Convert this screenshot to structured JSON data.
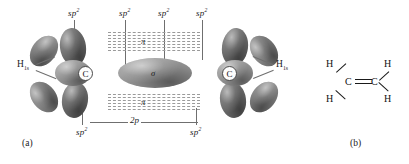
{
  "figure": {
    "panels": [
      {
        "caption": "(a)",
        "description": "sp2 hybrid orbital model of ethene with 2p pi overlap"
      },
      {
        "caption": "(b)",
        "description": "Lewis structure of ethene"
      }
    ]
  },
  "panel_a": {
    "caption": "(a)",
    "hybrid_labels": [
      {
        "text": "sp",
        "exponent": "2"
      },
      {
        "text": "sp",
        "exponent": "2"
      },
      {
        "text": "sp",
        "exponent": "2"
      },
      {
        "text": "sp",
        "exponent": "2"
      },
      {
        "text": "sp",
        "exponent": "2"
      },
      {
        "text": "sp",
        "exponent": "2"
      }
    ],
    "p_orbital_label": "2p",
    "hydrogen_labels": [
      {
        "element": "H",
        "subscript": "1s"
      },
      {
        "element": "H",
        "subscript": "1s"
      },
      {
        "element": "H",
        "subscript": "1s"
      },
      {
        "element": "H",
        "subscript": "1s"
      }
    ],
    "carbon_labels": [
      "C",
      "C"
    ],
    "pi_markers": [
      "π",
      "σ",
      "π"
    ],
    "colors": {
      "lobe_dark": "#6d6d6d",
      "lobe_mid": "#828282",
      "lobe_light": "#9b9b9b",
      "leader_line": "#6f6f6f",
      "dashed_pi": "#9a9a9a",
      "text": "#1a1a1a",
      "background": "#ffffff"
    }
  },
  "panel_b": {
    "caption": "(b)",
    "atoms": [
      {
        "symbol": "H"
      },
      {
        "symbol": "H"
      },
      {
        "symbol": "C"
      },
      {
        "symbol": "C"
      },
      {
        "symbol": "H"
      },
      {
        "symbol": "H"
      }
    ],
    "bond_type": "double",
    "colors": {
      "bond": "#1a1a1a",
      "text": "#111111"
    }
  }
}
